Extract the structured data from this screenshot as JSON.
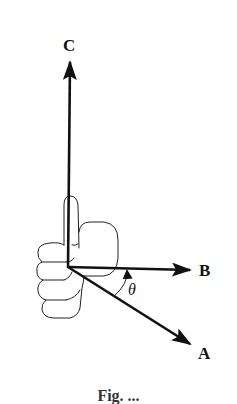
{
  "figure": {
    "vectors": [
      {
        "name": "A",
        "label": "A"
      },
      {
        "name": "B",
        "label": "B"
      },
      {
        "name": "C",
        "label": "C"
      }
    ],
    "angle_label": "θ",
    "caption_partial": "Fig. ..."
  },
  "colors": {
    "ink": "#111111",
    "background": "#ffffff"
  }
}
